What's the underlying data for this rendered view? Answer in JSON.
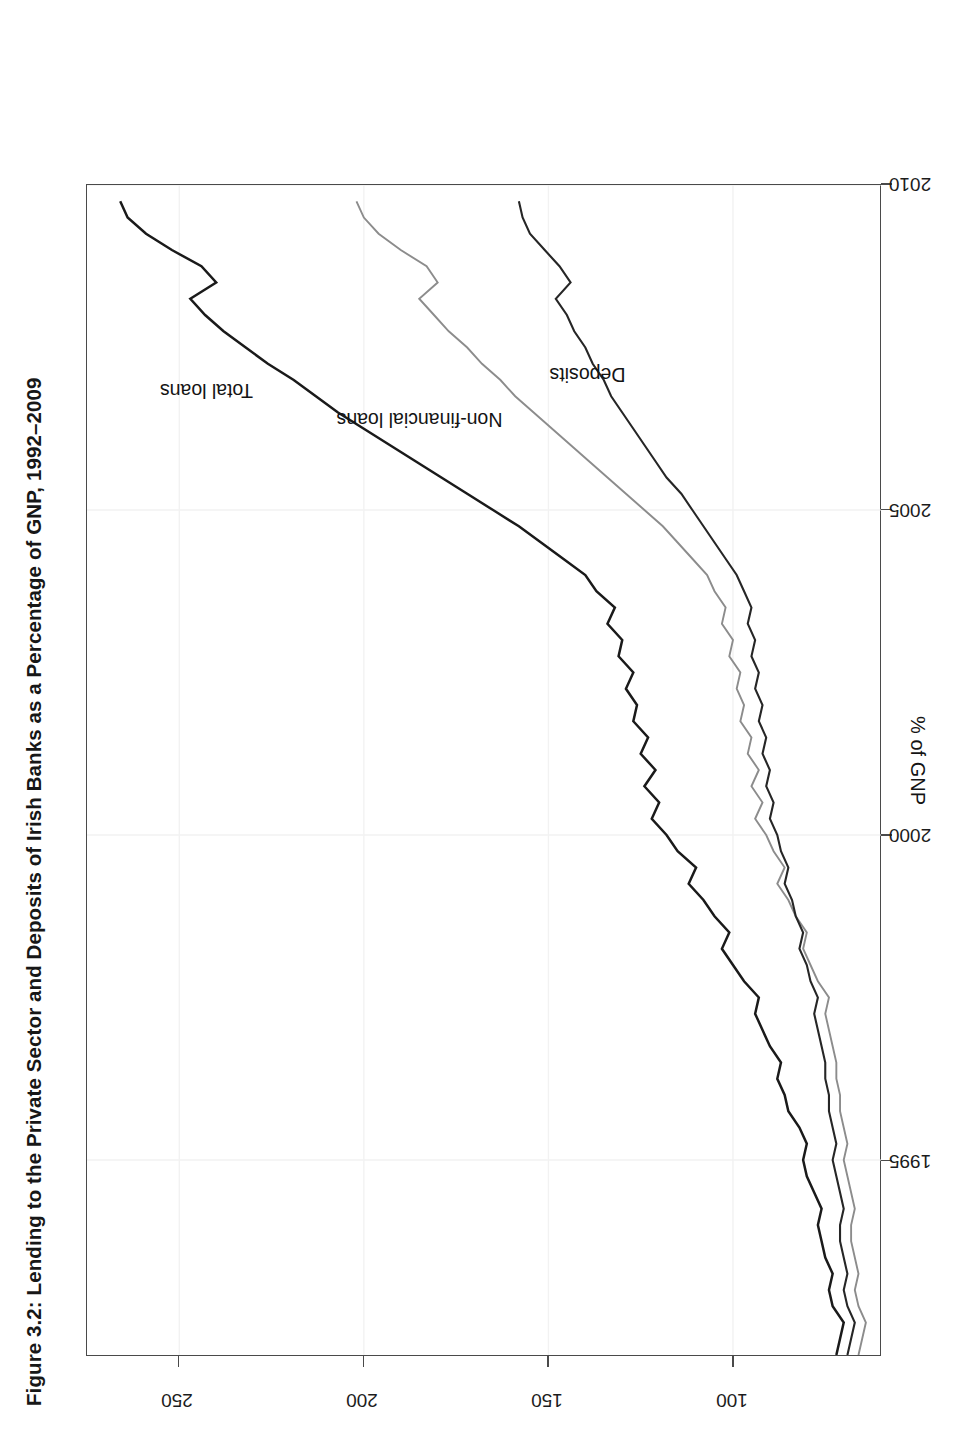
{
  "figure": {
    "title": "Figure 3.2: Lending to the Private Sector and Deposits of Irish Banks as a Percentage of GNP, 1992–2009"
  },
  "axes": {
    "y_axis_title": "% of GNP",
    "x_tick_labels": [
      "1995",
      "2000",
      "2005",
      "2010"
    ],
    "y_tick_labels": [
      "100",
      "150",
      "200",
      "250"
    ]
  },
  "annotations": {
    "total_loans": "Total loans",
    "non_financial_loans": "Non-financial loans",
    "deposits": "Deposits"
  },
  "colors": {
    "total_loans": "#1a1a1a",
    "non_financial_loans": "#8c8c8c",
    "deposits": "#262626",
    "frame": "#4a4a4a",
    "grid": "#f2f2f2",
    "background": "#ffffff"
  },
  "chart_data": {
    "type": "line",
    "title": "Figure 3.2: Lending to the Private Sector and Deposits of Irish Banks as a Percentage of GNP, 1992–2009",
    "xlabel": "",
    "ylabel": "% of GNP",
    "xlim": [
      1992,
      2010
    ],
    "ylim": [
      60,
      275
    ],
    "xticks": [
      1995,
      2000,
      2005,
      2010
    ],
    "yticks": [
      100,
      150,
      200,
      250
    ],
    "grid": false,
    "legend_position": "inline-annotations",
    "x": [
      1992.0,
      1992.25,
      1992.5,
      1992.75,
      1993.0,
      1993.25,
      1993.5,
      1993.75,
      1994.0,
      1994.25,
      1994.5,
      1994.75,
      1995.0,
      1995.25,
      1995.5,
      1995.75,
      1996.0,
      1996.25,
      1996.5,
      1996.75,
      1997.0,
      1997.25,
      1997.5,
      1997.75,
      1998.0,
      1998.25,
      1998.5,
      1998.75,
      1999.0,
      1999.25,
      1999.5,
      1999.75,
      2000.0,
      2000.25,
      2000.5,
      2000.75,
      2001.0,
      2001.25,
      2001.5,
      2001.75,
      2002.0,
      2002.25,
      2002.5,
      2002.75,
      2003.0,
      2003.25,
      2003.5,
      2003.75,
      2004.0,
      2004.25,
      2004.5,
      2004.75,
      2005.0,
      2005.25,
      2005.5,
      2005.75,
      2006.0,
      2006.25,
      2006.5,
      2006.75,
      2007.0,
      2007.25,
      2007.5,
      2007.75,
      2008.0,
      2008.25,
      2008.5,
      2008.75,
      2009.0,
      2009.25,
      2009.5,
      2009.75
    ],
    "series": [
      {
        "name": "Total loans",
        "color": "#1a1a1a",
        "values": [
          72,
          71,
          70,
          73,
          74,
          73,
          75,
          76,
          77,
          76,
          78,
          80,
          81,
          80,
          82,
          85,
          86,
          88,
          87,
          90,
          92,
          94,
          93,
          97,
          100,
          103,
          101,
          105,
          108,
          112,
          110,
          115,
          118,
          122,
          120,
          124,
          121,
          125,
          123,
          127,
          126,
          129,
          127,
          131,
          130,
          134,
          132,
          137,
          140,
          146,
          152,
          158,
          165,
          172,
          179,
          186,
          193,
          200,
          207,
          213,
          219,
          226,
          232,
          238,
          243,
          247,
          240,
          244,
          252,
          259,
          264,
          266
        ]
      },
      {
        "name": "Non-financial loans",
        "color": "#8c8c8c",
        "values": [
          66,
          65,
          64,
          66,
          67,
          66,
          67,
          68,
          68,
          67,
          68,
          69,
          70,
          69,
          70,
          71,
          71,
          72,
          72,
          73,
          74,
          75,
          74,
          77,
          79,
          81,
          80,
          83,
          85,
          88,
          86,
          89,
          91,
          94,
          92,
          95,
          93,
          96,
          95,
          98,
          97,
          99,
          98,
          101,
          100,
          103,
          102,
          105,
          107,
          111,
          115,
          119,
          124,
          129,
          134,
          139,
          144,
          149,
          154,
          159,
          163,
          168,
          172,
          177,
          181,
          185,
          180,
          183,
          190,
          196,
          200,
          202
        ]
      },
      {
        "name": "Deposits",
        "color": "#262626",
        "values": [
          69,
          68,
          67,
          69,
          70,
          69,
          70,
          71,
          71,
          70,
          71,
          72,
          73,
          72,
          73,
          74,
          74,
          75,
          75,
          76,
          77,
          78,
          77,
          79,
          80,
          82,
          81,
          83,
          84,
          86,
          85,
          87,
          88,
          90,
          89,
          91,
          90,
          92,
          91,
          93,
          92,
          94,
          93,
          95,
          94,
          96,
          95,
          97,
          99,
          102,
          105,
          108,
          111,
          114,
          118,
          121,
          124,
          127,
          130,
          133,
          135,
          138,
          140,
          143,
          145,
          148,
          144,
          147,
          151,
          155,
          157,
          158
        ]
      }
    ]
  }
}
